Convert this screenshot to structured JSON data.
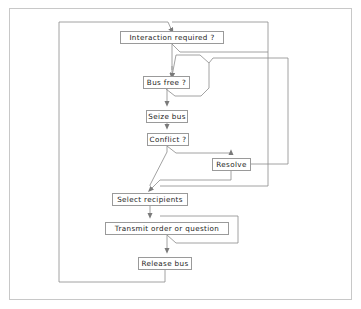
{
  "diagram": {
    "frame": {
      "border_color": "#c8c8c8",
      "background": "#ffffff"
    },
    "style": {
      "node_border_color": "#9a9a9a",
      "node_fill": "#ffffff",
      "connector_color": "#808080",
      "text_color": "#1a1a1a"
    },
    "nodes": [
      {
        "id": "interaction",
        "label": "Interaction required ?",
        "x": 120,
        "y": 31,
        "w": 104,
        "h": 13
      },
      {
        "id": "busfree",
        "label": "Bus free ?",
        "x": 143,
        "y": 76,
        "w": 47,
        "h": 13
      },
      {
        "id": "seize",
        "label": "Seize bus",
        "x": 146,
        "y": 110,
        "w": 42,
        "h": 13
      },
      {
        "id": "conflict",
        "label": "Conflict ?",
        "x": 147,
        "y": 133,
        "w": 42,
        "h": 13
      },
      {
        "id": "resolve",
        "label": "Resolve",
        "x": 212,
        "y": 158,
        "w": 39,
        "h": 13
      },
      {
        "id": "select",
        "label": "Select recipients",
        "x": 112,
        "y": 193,
        "w": 76,
        "h": 13
      },
      {
        "id": "transmit",
        "label": "Transmit order or question",
        "x": 105,
        "y": 222,
        "w": 124,
        "h": 13
      },
      {
        "id": "release",
        "label": "Release bus",
        "x": 138,
        "y": 257,
        "w": 54,
        "h": 13
      }
    ],
    "connectors": [
      {
        "id": "entry-into-interaction",
        "from": "left-rail-top",
        "to": "interaction"
      },
      {
        "id": "interaction-no-loop",
        "from": "interaction",
        "to": "right-rail-outer"
      },
      {
        "id": "interaction-to-busfree",
        "from": "interaction",
        "to": "busfree"
      },
      {
        "id": "busfree-no-loop",
        "from": "busfree",
        "to": "right-rail-inner"
      },
      {
        "id": "busfree-to-seize",
        "from": "busfree",
        "to": "seize"
      },
      {
        "id": "seize-to-conflict",
        "from": "seize",
        "to": "conflict"
      },
      {
        "id": "conflict-yes-to-resolve",
        "from": "conflict",
        "to": "resolve"
      },
      {
        "id": "conflict-no-to-select",
        "from": "conflict",
        "to": "select"
      },
      {
        "id": "resolve-back-to-busfree",
        "from": "resolve",
        "to": "busfree"
      },
      {
        "id": "resolve-to-select",
        "from": "resolve",
        "to": "select"
      },
      {
        "id": "select-to-transmit",
        "from": "select",
        "to": "transmit"
      },
      {
        "id": "transmit-loop-back",
        "from": "transmit",
        "to": "transmit"
      },
      {
        "id": "transmit-to-release",
        "from": "transmit",
        "to": "release"
      },
      {
        "id": "release-to-left-rail",
        "from": "release",
        "to": "left-rail-top"
      }
    ]
  }
}
